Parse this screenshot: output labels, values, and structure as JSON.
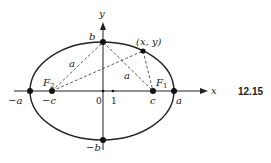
{
  "figure": {
    "number": "12.15",
    "type": "ellipse with foci diagram"
  },
  "axes": {
    "x_label": "x",
    "y_label": "y",
    "origin_label": "0",
    "unit_label": "1"
  },
  "points": {
    "vertex_left": "−a",
    "vertex_right": "a",
    "covertex_top": "b",
    "covertex_bottom": "−b",
    "focus_left_coord": "−c",
    "focus_right_coord": "c",
    "focus_left_name": "F",
    "focus_left_sub": "2",
    "focus_right_name": "F",
    "focus_right_sub": "1",
    "general_point": "(x, y)"
  },
  "segments": {
    "left_segment_label": "a",
    "right_segment_label": "a"
  },
  "colors": {
    "ink": "#222222",
    "background": "#ffffff"
  }
}
